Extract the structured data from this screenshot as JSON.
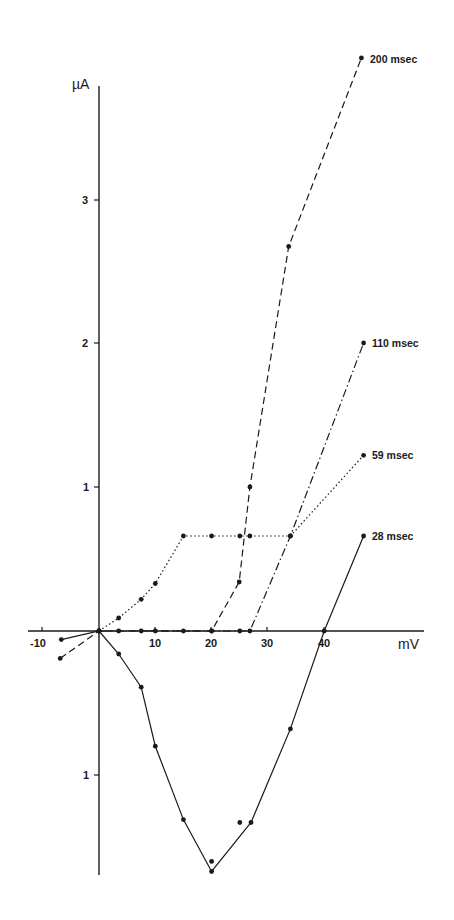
{
  "chart_data": {
    "type": "line",
    "title": "",
    "xlabel": "mV",
    "ylabel": "µA",
    "xlim": [
      -11,
      50
    ],
    "ylim": [
      -1.72,
      3.8
    ],
    "x_ticks": [
      -10,
      10,
      20,
      30,
      40
    ],
    "x_tick_labels": [
      "-10",
      "10",
      "20",
      "30",
      "40"
    ],
    "y_ticks": [
      3,
      2,
      1,
      -1
    ],
    "y_tick_labels": [
      "3",
      "2",
      "1",
      "1"
    ],
    "grid": false,
    "legend_position": "inline labels at right end of each series",
    "series": [
      {
        "name": "200 msec",
        "style": "dashed",
        "x": [
          -6.9,
          0,
          3.5,
          7.5,
          10,
          15,
          20,
          24.9,
          26.8,
          33.7,
          46.6
        ],
        "y": [
          -0.19,
          0,
          0,
          0,
          0,
          0,
          0,
          0.34,
          1.0,
          2.67,
          3.98
        ]
      },
      {
        "name": "110 msec",
        "style": "dash-dot",
        "x": [
          0,
          20,
          25,
          26.8,
          34,
          47
        ],
        "y": [
          0,
          0,
          0,
          0,
          0.66,
          2.0
        ]
      },
      {
        "name": "59 msec",
        "style": "dotted",
        "x": [
          0,
          3.5,
          7.5,
          10,
          15,
          20,
          25,
          26.8,
          34,
          47
        ],
        "y": [
          0,
          0.09,
          0.22,
          0.33,
          0.66,
          0.66,
          0.66,
          0.66,
          0.66,
          1.22
        ]
      },
      {
        "name": "28 msec",
        "style": "solid",
        "x": [
          -6.7,
          0,
          3.5,
          7.5,
          10,
          15,
          20,
          27,
          34,
          40,
          47
        ],
        "y": [
          -0.06,
          0,
          -0.16,
          -0.39,
          -0.8,
          -1.31,
          -1.67,
          -1.33,
          -0.68,
          0,
          0.66
        ]
      }
    ],
    "extra_points": [
      {
        "x": 20,
        "y": -1.6
      },
      {
        "x": 25,
        "y": -1.33
      }
    ]
  },
  "labels": {
    "y_axis": "µA",
    "x_axis": "mV",
    "s200": "200 msec",
    "s110": "110 msec",
    "s59": "59 msec",
    "s28": "28 msec",
    "xt_m10": "-10",
    "xt_10": "10",
    "xt_20": "20",
    "xt_30": "30",
    "xt_40": "40",
    "yt_3": "3",
    "yt_2": "2",
    "yt_1": "1",
    "yt_m1": "1"
  }
}
